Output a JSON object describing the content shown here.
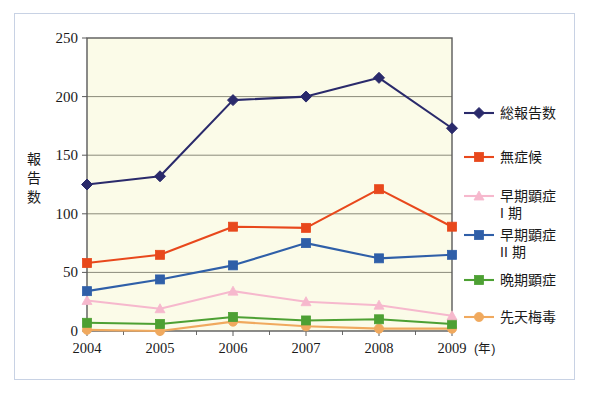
{
  "chart_data": {
    "type": "line",
    "title": "",
    "xlabel": "(年)",
    "ylabel": "報告数",
    "categories": [
      "2004",
      "2005",
      "2006",
      "2007",
      "2008",
      "2009"
    ],
    "xlim": [
      2004,
      2009
    ],
    "ylim": [
      0,
      250
    ],
    "yticks": [
      0,
      50,
      100,
      150,
      200,
      250
    ],
    "grid": true,
    "legend_position": "right",
    "series": [
      {
        "name": "総報告数",
        "color": "#2a2a6b",
        "marker": "diamond",
        "values": [
          125,
          132,
          197,
          200,
          216,
          173
        ]
      },
      {
        "name": "無症候",
        "color": "#e8481c",
        "marker": "square",
        "values": [
          58,
          65,
          89,
          88,
          121,
          89
        ]
      },
      {
        "name": "早期顕症\nI 期",
        "color": "#f6b8cd",
        "marker": "triangle",
        "values": [
          26,
          19,
          34,
          25,
          22,
          13
        ]
      },
      {
        "name": "早期顕症\nII 期",
        "color": "#2f5fa8",
        "marker": "square",
        "values": [
          34,
          44,
          56,
          75,
          62,
          65
        ]
      },
      {
        "name": "晩期顕症",
        "color": "#4da033",
        "marker": "square",
        "values": [
          7,
          6,
          12,
          9,
          10,
          6
        ]
      },
      {
        "name": "先天梅毒",
        "color": "#f0a95e",
        "marker": "circle",
        "values": [
          1,
          0,
          8,
          4,
          2,
          2
        ]
      }
    ]
  },
  "axes": {
    "y_tick_labels": [
      "250",
      "200",
      "150",
      "100",
      "50",
      "0"
    ],
    "y_axis_title_chars": [
      "報",
      "告",
      "数"
    ],
    "x_tick_labels": [
      "2004",
      "2005",
      "2006",
      "2007",
      "2008",
      "2009"
    ],
    "x_unit_label": "(年)"
  },
  "legend": {
    "entries": [
      {
        "label_lines": [
          "総報告数"
        ],
        "color": "#2a2a6b",
        "marker": "diamond"
      },
      {
        "label_lines": [
          "無症候"
        ],
        "color": "#e8481c",
        "marker": "square"
      },
      {
        "label_lines": [
          "早期顕症",
          "I 期"
        ],
        "color": "#f6b8cd",
        "marker": "triangle"
      },
      {
        "label_lines": [
          "早期顕症",
          "II 期"
        ],
        "color": "#2f5fa8",
        "marker": "square"
      },
      {
        "label_lines": [
          "晩期顕症"
        ],
        "color": "#4da033",
        "marker": "square"
      },
      {
        "label_lines": [
          "先天梅毒"
        ],
        "color": "#f0a95e",
        "marker": "circle"
      }
    ]
  },
  "style": {
    "plot_background": "#fbfbe8",
    "plot_border": "#5a5a5a",
    "grid_color": "#8a8a7a",
    "outer_border": "#c8d2e4",
    "page_background": "#ffffff"
  }
}
